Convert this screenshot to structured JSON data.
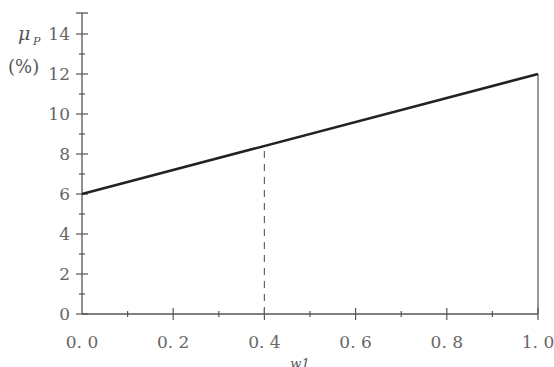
{
  "chart_data": {
    "type": "line",
    "title": "",
    "xlabel": "w1",
    "ylabel": "μP (%)",
    "ylabel_symbol": "μ",
    "ylabel_subscript": "P",
    "ylabel_unit": "(%)",
    "xlim": [
      0.0,
      1.0
    ],
    "ylim": [
      0,
      14
    ],
    "x_ticks": [
      "0.0",
      "0.2",
      "0.4",
      "0.6",
      "0.8",
      "1.0"
    ],
    "y_ticks": [
      "0",
      "2",
      "4",
      "6",
      "8",
      "10",
      "12",
      "14"
    ],
    "grid": false,
    "legend": null,
    "series": [
      {
        "name": "expected portfolio return",
        "x": [
          0.0,
          1.0
        ],
        "y": [
          6,
          12
        ],
        "color": "#222222"
      }
    ],
    "annotations": [
      {
        "type": "dashed-vertical",
        "x": 0.4,
        "y_from": 0,
        "y_to": 8.4
      },
      {
        "type": "solid-vertical",
        "x": 1.0,
        "y_from": 0,
        "y_to": 12
      }
    ]
  },
  "colors": {
    "axis": "#555555",
    "line": "#222222",
    "dashed": "#666666"
  }
}
